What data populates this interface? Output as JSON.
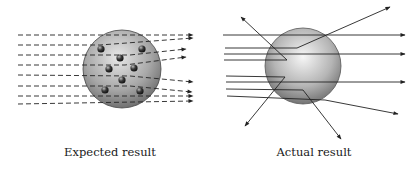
{
  "panels": [
    {
      "id": "expected",
      "caption": "Expected result",
      "model": "plum-pudding",
      "sphere": {
        "cx": 122,
        "cy": 69,
        "r": 39
      },
      "electrons": [
        {
          "cx": 101,
          "cy": 49
        },
        {
          "cx": 142,
          "cy": 49
        },
        {
          "cx": 120,
          "cy": 58
        },
        {
          "cx": 109,
          "cy": 69
        },
        {
          "cx": 134,
          "cy": 68
        },
        {
          "cx": 122,
          "cy": 80
        },
        {
          "cx": 105,
          "cy": 90
        },
        {
          "cx": 140,
          "cy": 91
        }
      ],
      "rays": [
        {
          "points": [
            [
              18,
              35
            ],
            [
              193,
              35
            ]
          ]
        },
        {
          "points": [
            [
              18,
              45
            ],
            [
              100,
              45
            ],
            [
              193,
              38
            ]
          ]
        },
        {
          "points": [
            [
              18,
              55
            ],
            [
              130,
              55
            ],
            [
              186,
              49
            ]
          ]
        },
        {
          "points": [
            [
              18,
              65
            ],
            [
              125,
              65
            ],
            [
              186,
              57
            ]
          ]
        },
        {
          "points": [
            [
              18,
              75
            ],
            [
              130,
              76
            ],
            [
              193,
              82
            ]
          ]
        },
        {
          "points": [
            [
              18,
              86
            ],
            [
              130,
              86
            ],
            [
              192,
              92
            ]
          ]
        },
        {
          "points": [
            [
              18,
              96
            ],
            [
              193,
              96
            ]
          ]
        },
        {
          "points": [
            [
              18,
              104
            ],
            [
              193,
              101
            ]
          ]
        }
      ],
      "ray_style": "dashed"
    },
    {
      "id": "actual",
      "caption": "Actual result",
      "model": "nuclear",
      "sphere": {
        "cx": 303,
        "cy": 66,
        "r": 38
      },
      "nucleus": {
        "cx": 288,
        "cy": 68
      },
      "rays": [
        {
          "points": [
            [
              223,
              35
            ],
            [
              405,
              35
            ]
          ]
        },
        {
          "points": [
            [
              225,
              48
            ],
            [
              297,
              48
            ],
            [
              390,
              7
            ]
          ]
        },
        {
          "points": [
            [
              224,
              54
            ],
            [
              405,
              54
            ]
          ]
        },
        {
          "points": [
            [
              224,
              60
            ],
            [
              287,
              60
            ],
            [
              241,
              17
            ]
          ]
        },
        {
          "points": [
            [
              226,
              76
            ],
            [
              285,
              77
            ],
            [
              245,
              126
            ]
          ]
        },
        {
          "points": [
            [
              226,
              82
            ],
            [
              405,
              82
            ]
          ]
        },
        {
          "points": [
            [
              226,
              89
            ],
            [
              303,
              90
            ],
            [
              341,
              139
            ]
          ]
        },
        {
          "points": [
            [
              227,
              96
            ],
            [
              325,
              100
            ],
            [
              398,
              114
            ]
          ]
        }
      ],
      "ray_style": "solid"
    }
  ],
  "colors": {
    "line": "#222222",
    "sphere_light": "#f2f2f2",
    "sphere_mid": "#a6a6a6",
    "sphere_dark": "#4a4a4a",
    "electron": "#2a2a2a"
  }
}
